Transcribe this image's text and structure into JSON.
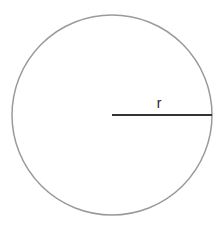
{
  "diagram": {
    "shape": "circle",
    "radius_label": "r",
    "colors": {
      "circle_stroke": "#9a9a9a",
      "radius_line": "#333333",
      "label": "#222222"
    }
  }
}
